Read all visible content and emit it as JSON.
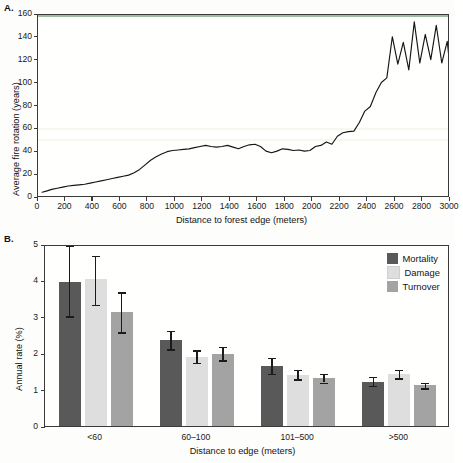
{
  "figure": {
    "background": "#fdfdfb",
    "panels": [
      {
        "id": "A",
        "label": "A."
      },
      {
        "id": "B",
        "label": "B."
      }
    ]
  },
  "panel_a": {
    "label": "A.",
    "chart_data": {
      "type": "line",
      "title": "",
      "xlabel": "Distance to forest edge (meters)",
      "ylabel": "Average fire rotation (years)",
      "xlim": [
        0,
        3000
      ],
      "ylim": [
        0,
        160
      ],
      "xticks": [
        0,
        200,
        400,
        600,
        800,
        1000,
        1200,
        1400,
        1600,
        1800,
        2000,
        2200,
        2400,
        2600,
        2800,
        3000
      ],
      "yticks": [
        0,
        20,
        40,
        60,
        80,
        100,
        120,
        140,
        160
      ],
      "grid": false,
      "legend": "none",
      "line_color": "#161616",
      "series": [
        {
          "name": "Average fire rotation",
          "x": [
            30,
            60,
            100,
            140,
            180,
            220,
            260,
            300,
            340,
            380,
            420,
            460,
            500,
            540,
            580,
            620,
            660,
            700,
            740,
            780,
            820,
            860,
            900,
            940,
            980,
            1020,
            1060,
            1100,
            1140,
            1180,
            1220,
            1260,
            1300,
            1340,
            1380,
            1420,
            1460,
            1500,
            1540,
            1580,
            1620,
            1660,
            1700,
            1740,
            1780,
            1820,
            1860,
            1900,
            1940,
            1980,
            2020,
            2060,
            2100,
            2140,
            2180,
            2220,
            2260,
            2300,
            2340,
            2380,
            2420,
            2460,
            2500,
            2540,
            2580,
            2620,
            2660,
            2700,
            2740,
            2780,
            2820,
            2860,
            2900,
            2940,
            2980,
            3000
          ],
          "y": [
            5,
            6,
            7.5,
            8.5,
            9.5,
            10.5,
            11,
            11.5,
            12,
            13,
            14,
            15,
            16,
            17,
            18,
            19,
            20,
            22,
            25,
            29,
            33,
            36,
            38.5,
            40.5,
            41.5,
            42,
            42.5,
            43,
            44,
            45,
            46,
            45,
            44.5,
            45,
            46,
            44.5,
            43,
            45,
            46.5,
            47,
            45,
            41,
            39.5,
            41,
            43,
            42.5,
            41.5,
            42,
            41,
            41.5,
            45,
            46,
            49,
            47,
            54,
            57,
            58,
            58.5,
            66,
            76,
            80,
            92,
            101,
            105,
            141,
            117,
            136,
            112,
            154,
            118,
            143,
            121,
            151,
            118,
            137,
            114
          ]
        }
      ]
    }
  },
  "panel_b": {
    "label": "B.",
    "chart_data": {
      "type": "bar",
      "title": "",
      "xlabel": "Distance to edge (meters)",
      "ylabel": "Annual rate (%)",
      "ylim": [
        0,
        5
      ],
      "yticks": [
        0,
        1,
        2,
        3,
        4,
        5
      ],
      "grid": false,
      "legend_position": "top-right",
      "categories": [
        "<60",
        "60–100",
        "101–500",
        ">500"
      ],
      "series": [
        {
          "name": "Mortality",
          "color": "#595959",
          "values": [
            4.01,
            2.41,
            1.69,
            1.27
          ],
          "err_low": [
            3.07,
            2.16,
            1.49,
            1.15
          ],
          "err_high": [
            5.0,
            2.67,
            1.92,
            1.41
          ]
        },
        {
          "name": "Damage",
          "color": "#dedede",
          "values": [
            4.1,
            1.95,
            1.46,
            1.47
          ],
          "err_low": [
            3.38,
            1.79,
            1.34,
            1.36
          ],
          "err_high": [
            4.72,
            2.13,
            1.59,
            1.59
          ]
        },
        {
          "name": "Turnover",
          "color": "#a3a3a3",
          "values": [
            3.18,
            2.04,
            1.36,
            1.17
          ],
          "err_low": [
            2.63,
            1.86,
            1.25,
            1.09
          ],
          "err_high": [
            3.73,
            2.23,
            1.49,
            1.25
          ]
        }
      ]
    },
    "legend": {
      "items": [
        {
          "label": "Mortality",
          "color": "#595959"
        },
        {
          "label": "Damage",
          "color": "#dedede"
        },
        {
          "label": "Turnover",
          "color": "#a3a3a3"
        }
      ]
    }
  }
}
